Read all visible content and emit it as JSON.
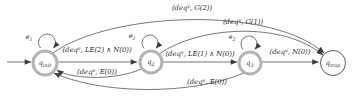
{
  "colors": {
    "background": "#ffffff",
    "line": "#3d3d3d",
    "state_ring": "#b4b4b4",
    "trap_ring": "#4a4a4a",
    "text": "#1f1f1f"
  },
  "states": [
    {
      "id": "q_init",
      "base": "q",
      "sub": "init"
    },
    {
      "id": "q_2",
      "base": "q",
      "sub": "2"
    },
    {
      "id": "q_3",
      "base": "q",
      "sub": "3"
    },
    {
      "id": "q_trap",
      "base": "q",
      "sub": "trap"
    }
  ],
  "self_loops": [
    {
      "state": "q_init",
      "base": "e",
      "sub": "1"
    },
    {
      "state": "q_2",
      "base": "e",
      "sub": "2"
    },
    {
      "state": "q_3",
      "base": "e",
      "sub": "2"
    }
  ],
  "transitions": [
    {
      "from": "start",
      "to": "q_init"
    },
    {
      "from": "q_init",
      "to": "q_2",
      "label": {
        "pre": "(deq",
        "sup": "v",
        "post": ", LE(2) ∧ N(0))"
      }
    },
    {
      "from": "q_2",
      "to": "q_3",
      "label": {
        "pre": "(deq",
        "sup": "v",
        "post": ", LE(1) ∧ N(0))"
      }
    },
    {
      "from": "q_3",
      "to": "q_trap",
      "label": {
        "pre": "(deq",
        "sup": "v",
        "post": ", N(0))"
      }
    },
    {
      "from": "q_init",
      "to": "q_trap",
      "label": {
        "pre": "(deq",
        "sup": "v",
        "post": ", G(2))"
      }
    },
    {
      "from": "q_2",
      "to": "q_trap",
      "label": {
        "pre": "(deq",
        "sup": "v",
        "post": ", G(1))"
      }
    },
    {
      "from": "q_2",
      "to": "q_init",
      "label": {
        "pre": "(deq",
        "sup": "v",
        "post": ", E(0))"
      }
    },
    {
      "from": "q_3",
      "to": "q_init",
      "label": {
        "pre": "(deq",
        "sup": "v",
        "post": ", E(0))"
      }
    }
  ]
}
